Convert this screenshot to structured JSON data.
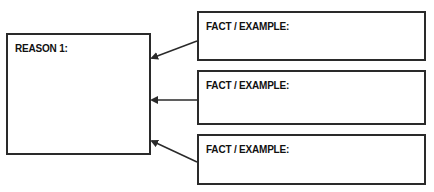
{
  "reason": {
    "label": "REASON 1:"
  },
  "facts": [
    {
      "label": "FACT / EXAMPLE:"
    },
    {
      "label": "FACT / EXAMPLE:"
    },
    {
      "label": "FACT / EXAMPLE:"
    }
  ],
  "colors": {
    "stroke": "#2a2a2a",
    "background": "#ffffff"
  }
}
